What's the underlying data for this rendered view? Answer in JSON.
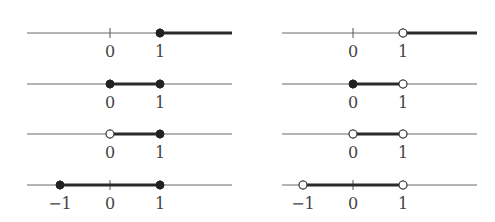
{
  "figure": {
    "left_column": [
      {
        "interval": "[1, ∞)",
        "ticks": [
          {
            "v": 0,
            "label": "0"
          },
          {
            "v": 1,
            "label": "1"
          }
        ],
        "start": {
          "v": 1,
          "type": "closed"
        },
        "end": {
          "v": "inf"
        }
      },
      {
        "interval": "[0, 1]",
        "ticks": [
          {
            "v": 0,
            "label": "0"
          },
          {
            "v": 1,
            "label": "1"
          }
        ],
        "start": {
          "v": 0,
          "type": "closed"
        },
        "end": {
          "v": 1,
          "type": "closed"
        }
      },
      {
        "interval": "(0, 1]",
        "ticks": [
          {
            "v": 0,
            "label": "0"
          },
          {
            "v": 1,
            "label": "1"
          }
        ],
        "start": {
          "v": 0,
          "type": "open"
        },
        "end": {
          "v": 1,
          "type": "closed"
        }
      },
      {
        "interval": "[-1, 1]",
        "ticks": [
          {
            "v": -1,
            "label": "−1"
          },
          {
            "v": 0,
            "label": "0"
          },
          {
            "v": 1,
            "label": "1"
          }
        ],
        "start": {
          "v": -1,
          "type": "closed"
        },
        "end": {
          "v": 1,
          "type": "closed"
        }
      }
    ],
    "right_column": [
      {
        "interval": "(1, ∞)",
        "ticks": [
          {
            "v": 0,
            "label": "0"
          },
          {
            "v": 1,
            "label": "1"
          }
        ],
        "start": {
          "v": 1,
          "type": "open"
        },
        "end": {
          "v": "inf"
        }
      },
      {
        "interval": "[0, 1)",
        "ticks": [
          {
            "v": 0,
            "label": "0"
          },
          {
            "v": 1,
            "label": "1"
          }
        ],
        "start": {
          "v": 0,
          "type": "closed"
        },
        "end": {
          "v": 1,
          "type": "open"
        }
      },
      {
        "interval": "(0, 1)",
        "ticks": [
          {
            "v": 0,
            "label": "0"
          },
          {
            "v": 1,
            "label": "1"
          }
        ],
        "start": {
          "v": 0,
          "type": "open"
        },
        "end": {
          "v": 1,
          "type": "open"
        }
      },
      {
        "interval": "(-1, 1)",
        "ticks": [
          {
            "v": -1,
            "label": "−1"
          },
          {
            "v": 0,
            "label": "0"
          },
          {
            "v": 1,
            "label": "1"
          }
        ],
        "start": {
          "v": -1,
          "type": "open"
        },
        "end": {
          "v": 1,
          "type": "open"
        }
      }
    ]
  },
  "layout": {
    "left": {
      "x_start": 27,
      "x_end": 232,
      "zero_x": 110,
      "unit": 50
    },
    "right": {
      "x_start": 282,
      "x_end": 477,
      "zero_x": 353,
      "unit": 50
    },
    "rows_y": [
      33,
      84,
      134,
      185
    ],
    "label_offset": 20
  },
  "colors": {
    "axis": "#6a6a6a",
    "segment": "#2a2a2a",
    "label": "#444444"
  }
}
